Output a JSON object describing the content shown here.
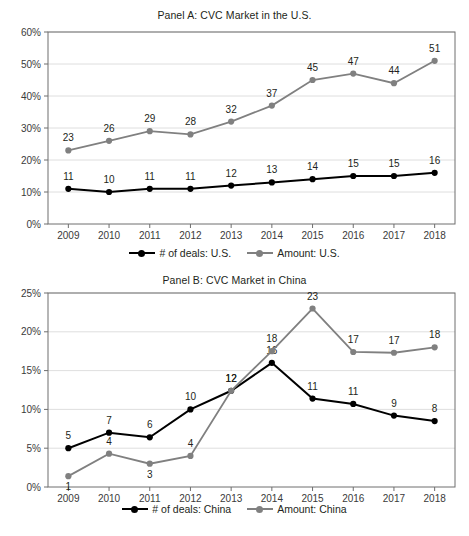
{
  "chart_data": [
    {
      "type": "line",
      "panel": "A",
      "title": "Panel A: CVC Market in the U.S.",
      "xlabel": "",
      "ylabel": "",
      "categories": [
        "2009",
        "2010",
        "2011",
        "2012",
        "2013",
        "2014",
        "2015",
        "2016",
        "2017",
        "2018"
      ],
      "ylim": [
        0,
        60
      ],
      "yticks": [
        "0%",
        "10%",
        "20%",
        "30%",
        "40%",
        "50%",
        "60%"
      ],
      "ytick_values": [
        0,
        10,
        20,
        30,
        40,
        50,
        60
      ],
      "grid": true,
      "legend_position": "bottom",
      "series": [
        {
          "name": "# of deals: U.S.",
          "color": "#000000",
          "values": [
            11,
            10,
            11,
            11,
            12,
            13,
            14,
            15,
            15,
            16
          ],
          "labels": [
            "11",
            "10",
            "11",
            "11",
            "12",
            "13",
            "14",
            "15",
            "15",
            "16"
          ]
        },
        {
          "name": "Amount: U.S.",
          "color": "#808080",
          "values": [
            23,
            26,
            29,
            28,
            32,
            37,
            45,
            47,
            44,
            51
          ],
          "labels": [
            "23",
            "26",
            "29",
            "28",
            "32",
            "37",
            "45",
            "47",
            "44",
            "51"
          ]
        }
      ]
    },
    {
      "type": "line",
      "panel": "B",
      "title": "Panel B: CVC Market in China",
      "xlabel": "",
      "ylabel": "",
      "categories": [
        "2009",
        "2010",
        "2011",
        "2012",
        "2013",
        "2014",
        "2015",
        "2016",
        "2017",
        "2018"
      ],
      "ylim": [
        0,
        25
      ],
      "yticks": [
        "0%",
        "5%",
        "10%",
        "15%",
        "20%",
        "25%"
      ],
      "ytick_values": [
        0,
        5,
        10,
        15,
        20,
        25
      ],
      "grid": true,
      "legend_position": "bottom",
      "series": [
        {
          "name": "# of deals: China",
          "color": "#000000",
          "values": [
            5,
            7,
            6.4,
            10,
            12.4,
            16,
            11.4,
            10.7,
            9.2,
            8.5
          ],
          "labels": [
            "5",
            "7",
            "6",
            "10",
            "12",
            "16",
            "11",
            "11",
            "9",
            "8"
          ]
        },
        {
          "name": "Amount: China",
          "color": "#808080",
          "values": [
            1.4,
            4.3,
            3,
            4,
            12.4,
            17.5,
            23,
            17.4,
            17.3,
            18
          ],
          "labels": [
            "1",
            "4",
            "3",
            "4",
            "12",
            "18",
            "23",
            "17",
            "17",
            "18"
          ]
        }
      ]
    }
  ],
  "panel_a": {
    "title": "Panel A: CVC Market in the U.S.",
    "legend": {
      "deals": "# of deals: U.S.",
      "amount": "Amount: U.S."
    }
  },
  "panel_b": {
    "title": "Panel B: CVC Market in China",
    "legend": {
      "deals": "# of deals: China",
      "amount": "Amount: China"
    }
  },
  "colors": {
    "deals_line": "#000000",
    "amount_line": "#808080",
    "grid": "#d6d6d6",
    "axis": "#6e6e6e",
    "text": "#231f20",
    "background": "#ffffff"
  }
}
